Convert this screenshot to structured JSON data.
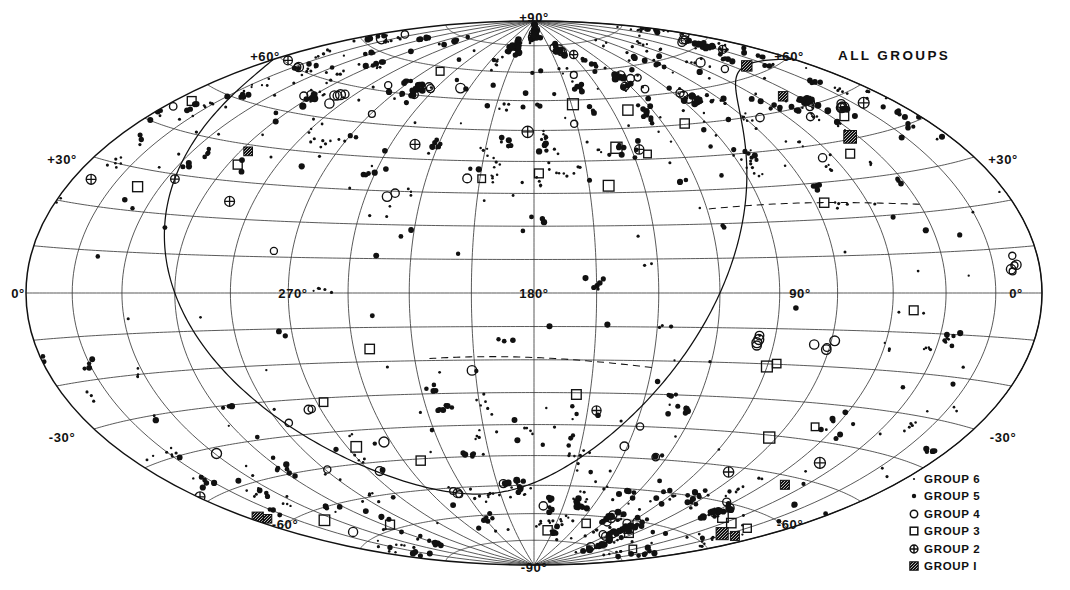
{
  "title": "ALL GROUPS",
  "chart_data": {
    "type": "scatter",
    "projection": "aitoff-hammer-equal-area-all-sky",
    "title": "ALL GROUPS",
    "xlabel": "Galactic longitude",
    "ylabel": "Galactic latitude",
    "xlim": [
      0,
      360
    ],
    "ylim": [
      -90,
      90
    ],
    "grid": true,
    "grid_spacing_lon_deg": 20,
    "grid_spacing_lat_deg": 10,
    "legend_position": "bottom-right",
    "longitude_ticks": [
      {
        "label": "270°",
        "value": 270,
        "x": 293,
        "y": 293
      },
      {
        "label": "180°",
        "value": 180,
        "x": 534,
        "y": 293
      },
      {
        "label": "90°",
        "value": 90,
        "x": 800,
        "y": 293
      }
    ],
    "latitude_ticks": [
      {
        "label": "+90°",
        "value": 90,
        "x": 534,
        "y": 17,
        "anchor": "top-pole"
      },
      {
        "label": "+60°",
        "value": 60,
        "x": 265,
        "y": 56,
        "anchor": "left"
      },
      {
        "label": "+60°",
        "value": 60,
        "x": 789,
        "y": 56,
        "anchor": "right"
      },
      {
        "label": "+30°",
        "value": 30,
        "x": 62,
        "y": 159,
        "anchor": "left"
      },
      {
        "label": "+30°",
        "value": 30,
        "x": 1003,
        "y": 159,
        "anchor": "right"
      },
      {
        "label": "0°",
        "value": 0,
        "x": 18,
        "y": 293,
        "anchor": "left"
      },
      {
        "label": "0°",
        "value": 0,
        "x": 1016,
        "y": 293,
        "anchor": "right"
      },
      {
        "label": "-30°",
        "value": -30,
        "x": 62,
        "y": 437,
        "anchor": "left"
      },
      {
        "label": "-30°",
        "value": -30,
        "x": 1003,
        "y": 437,
        "anchor": "right"
      },
      {
        "label": "-60°",
        "value": -60,
        "x": 285,
        "y": 524,
        "anchor": "left"
      },
      {
        "label": "-60°",
        "value": -60,
        "x": 790,
        "y": 524,
        "anchor": "right"
      },
      {
        "label": "-90°",
        "value": -90,
        "x": 534,
        "y": 567,
        "anchor": "bottom-pole"
      }
    ],
    "legend": [
      {
        "label": "GROUP  6",
        "symbol": "tiny-dot",
        "group": 6,
        "size": 1.3
      },
      {
        "label": "GROUP  5",
        "symbol": "filled-dot",
        "group": 5,
        "size": 2.6
      },
      {
        "label": "GROUP  4",
        "symbol": "open-circle",
        "group": 4,
        "size": 4.2
      },
      {
        "label": "GROUP  3",
        "symbol": "open-square",
        "group": 3,
        "size": 4.6
      },
      {
        "label": "GROUP  2",
        "symbol": "crossed-circle",
        "group": 2,
        "size": 4.8
      },
      {
        "label": "GROUP  I",
        "symbol": "filled-square",
        "group": 1,
        "size": 5.4
      }
    ],
    "overlay_curves": [
      {
        "name": "equator-trace",
        "style": "solid",
        "description": "celestial equator great circle crossing western hemisphere"
      },
      {
        "name": "dashed-band-north",
        "style": "dashed"
      },
      {
        "name": "dashed-band-south",
        "style": "dashed"
      }
    ],
    "colors": {
      "ink": "#111111",
      "grid": "#4a4a4a",
      "background": "#ffffff"
    },
    "marker_counts": {
      "group_6": 520,
      "group_5": 430,
      "group_4": 62,
      "group_3": 34,
      "group_2": 14,
      "group_1": 9
    },
    "density_note": "Markers concentrate along two broad bands: a northern concentration between +30° and +75° and a southern concentration between -30° and -75°, with a sparse equatorial zone."
  }
}
